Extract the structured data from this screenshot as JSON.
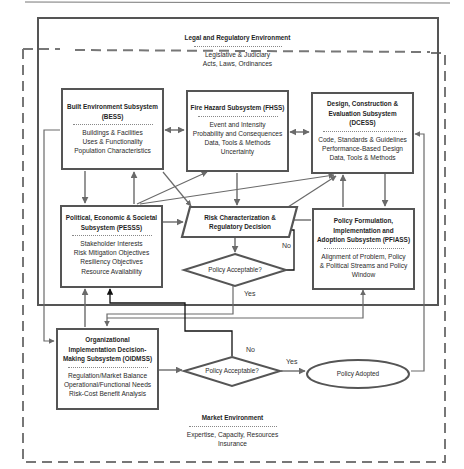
{
  "legal_environment": {
    "title": "Legal and Regulatory Environment",
    "lines": [
      "Legislative & Judiciary",
      "Acts, Laws, Ordinances"
    ]
  },
  "market_environment": {
    "title": "Market Environment",
    "lines": [
      "Expertise, Capacity, Resources",
      "Insurance"
    ]
  },
  "subsystems": {
    "bess": {
      "title": [
        "Built Environment Subsystem",
        "(BESS)"
      ],
      "items": [
        "Buildings & Facilities",
        "Uses & Functionality",
        "Population Characteristics"
      ]
    },
    "fhss": {
      "title": [
        "Fire Hazard Subsystem (FHSS)"
      ],
      "items": [
        "Event and Intensity",
        "Probability and Consequences",
        "Data, Tools & Methods",
        "Uncertainty"
      ]
    },
    "dcess": {
      "title": [
        "Design, Construction &",
        "Evaluation Subsystem",
        "(DCESS)"
      ],
      "items": [
        "Code, Standards & Guidelines",
        "Performance-Based Design",
        "Data, Tools & Methods"
      ]
    },
    "pesss": {
      "title": [
        "Political, Economic & Societal",
        "Subsystem (PESSS)"
      ],
      "items": [
        "Stakeholder Interests",
        "Risk Mitigation Objectives",
        "Resiliency Objectives",
        "Resource Availability"
      ]
    },
    "pfiass": {
      "title": [
        "Policy Formulation,",
        "Implementation and",
        "Adoption Subsystem (PFIASS)"
      ],
      "items": [
        "Alignment of Problem, Policy",
        "& Political Streams and Policy",
        "Window"
      ]
    },
    "oidmss": {
      "title": [
        "Organizational",
        "Implementation Decision-",
        "Making Subsystem (OIDMSS)"
      ],
      "items": [
        "Regulation/Market Balance",
        "Operational/Functional Needs",
        "Risk-Cost Benefit Analysis"
      ]
    }
  },
  "risk_decision": {
    "lines": [
      "Risk Characterization &",
      "Regulatory Decision"
    ]
  },
  "decision_1": {
    "label": "Policy Acceptable?",
    "no": "No",
    "yes": "Yes"
  },
  "decision_2": {
    "label": "Policy Acceptable?",
    "no": "No",
    "yes": "Yes"
  },
  "policy_adopted": {
    "label": "Policy Adopted"
  },
  "colors": {
    "line": "#6a6a6a",
    "box_border": "#555555",
    "dark_line": "#111111",
    "dash": "#777777"
  }
}
